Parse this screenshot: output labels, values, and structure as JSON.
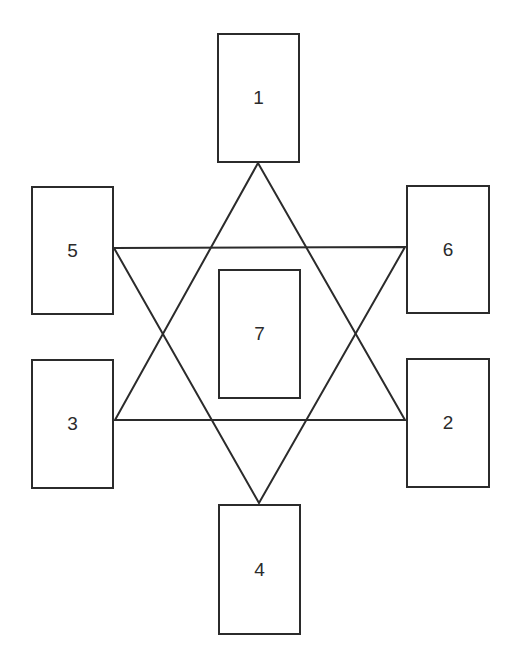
{
  "diagram": {
    "type": "card-spread-hexagram",
    "stroke_color": "#2b2b2b",
    "background": "#ffffff",
    "cards": [
      {
        "label": "1",
        "x": 217,
        "y": 33,
        "w": 83,
        "h": 130
      },
      {
        "label": "2",
        "x": 406,
        "y": 358,
        "w": 84,
        "h": 130
      },
      {
        "label": "3",
        "x": 31,
        "y": 359,
        "w": 83,
        "h": 130
      },
      {
        "label": "4",
        "x": 218,
        "y": 504,
        "w": 83,
        "h": 131
      },
      {
        "label": "5",
        "x": 31,
        "y": 186,
        "w": 83,
        "h": 129
      },
      {
        "label": "6",
        "x": 406,
        "y": 185,
        "w": 84,
        "h": 129
      },
      {
        "label": "7",
        "x": 218,
        "y": 269,
        "w": 83,
        "h": 130
      }
    ],
    "triangles": [
      {
        "name": "upward-triangle",
        "points": [
          [
            258,
            163
          ],
          [
            115,
            420
          ],
          [
            405,
            420
          ]
        ]
      },
      {
        "name": "downward-triangle",
        "points": [
          [
            114,
            248
          ],
          [
            405,
            247
          ],
          [
            259,
            503
          ]
        ]
      }
    ]
  }
}
